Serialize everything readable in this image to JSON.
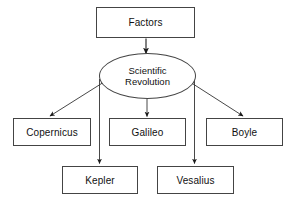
{
  "diagram": {
    "type": "flowchart",
    "background_color": "#ffffff",
    "stroke_color": "#444444",
    "text_color": "#111111",
    "nodes": {
      "factors": {
        "label": "Factors",
        "shape": "rectangle"
      },
      "scientific_revolution": {
        "label": "Scientific\nRevolution",
        "shape": "ellipse"
      },
      "copernicus": {
        "label": "Copernicus",
        "shape": "rectangle"
      },
      "galileo": {
        "label": "Galileo",
        "shape": "rectangle"
      },
      "boyle": {
        "label": "Boyle",
        "shape": "rectangle"
      },
      "kepler": {
        "label": "Kepler",
        "shape": "rectangle"
      },
      "vesalius": {
        "label": "Vesalius",
        "shape": "rectangle"
      }
    },
    "edges": [
      {
        "from": "Factors",
        "to": "Scientific Revolution"
      },
      {
        "from": "Scientific Revolution",
        "to": "Copernicus"
      },
      {
        "from": "Scientific Revolution",
        "to": "Galileo"
      },
      {
        "from": "Scientific Revolution",
        "to": "Boyle"
      },
      {
        "from": "Scientific Revolution",
        "to": "Kepler"
      },
      {
        "from": "Scientific Revolution",
        "to": "Vesalius"
      }
    ]
  }
}
